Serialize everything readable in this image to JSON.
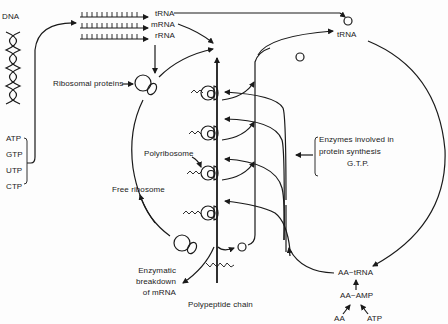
{
  "figure": {
    "colors": {
      "ink": "#1a1a1a",
      "background": "#fdfdfd"
    }
  },
  "labels": {
    "dna": "DNA",
    "trna_top": "tRNA",
    "mrna": "mRNA",
    "rrna": "rRNA",
    "trna_right": "tRNA",
    "ribosomal_proteins": "Ribosomal proteins",
    "polyribosome": "Polyribosome",
    "free_ribosome": "Free ribosome",
    "enzymes_line1": "Enzymes involved in",
    "enzymes_line2": "protein synthesis",
    "enzymes_line3": "G.T.P.",
    "enzymatic_line1": "Enzymatic",
    "enzymatic_line2": "breakdown",
    "enzymatic_line3": "of mRNA",
    "polypeptide_chain": "Polypeptide chain",
    "aa_trna": "AA~tRNA",
    "aa_amp": "AA~AMP",
    "aa": "AA",
    "atp_bottom": "ATP"
  },
  "nucleotides": [
    "ATP",
    "GTP",
    "UTP",
    "CTP"
  ],
  "nodes": [
    {
      "id": "dna",
      "label": "DNA"
    },
    {
      "id": "trna",
      "label": "tRNA"
    },
    {
      "id": "mrna",
      "label": "mRNA"
    },
    {
      "id": "rrna",
      "label": "rRNA"
    },
    {
      "id": "ribosome_assembly",
      "label": "Ribosomal proteins"
    },
    {
      "id": "polyribosome",
      "label": "Polyribosome"
    },
    {
      "id": "free_ribosome",
      "label": "Free ribosome"
    },
    {
      "id": "enzymes",
      "label": "Enzymes involved in protein synthesis G.T.P."
    },
    {
      "id": "mrna_breakdown",
      "label": "Enzymatic breakdown of mRNA"
    },
    {
      "id": "polypeptide",
      "label": "Polypeptide chain"
    },
    {
      "id": "aa_trna",
      "label": "AA~tRNA"
    },
    {
      "id": "aa_amp",
      "label": "AA~AMP"
    },
    {
      "id": "aa",
      "label": "AA"
    },
    {
      "id": "atp",
      "label": "ATP"
    }
  ],
  "edges": [
    {
      "from": "nucleotides",
      "to": "mrna"
    },
    {
      "from": "trna",
      "to": "trna_free"
    },
    {
      "from": "mrna",
      "to": "polyribosome"
    },
    {
      "from": "rrna",
      "to": "ribosome_assembly"
    },
    {
      "from": "ribosome_assembly",
      "to": "polyribosome"
    },
    {
      "from": "polyribosome",
      "to": "trna"
    },
    {
      "from": "trna",
      "to": "aa_trna"
    },
    {
      "from": "aa_trna",
      "to": "polyribosome"
    },
    {
      "from": "aa_amp",
      "to": "aa_trna"
    },
    {
      "from": "aa",
      "to": "aa_amp"
    },
    {
      "from": "atp",
      "to": "aa_amp"
    },
    {
      "from": "enzymes",
      "to": "polyribosome"
    },
    {
      "from": "polyribosome",
      "to": "polypeptide"
    },
    {
      "from": "polyribosome",
      "to": "mrna_breakdown"
    },
    {
      "from": "free_ribosome",
      "to": "ribosome_assembly"
    }
  ]
}
